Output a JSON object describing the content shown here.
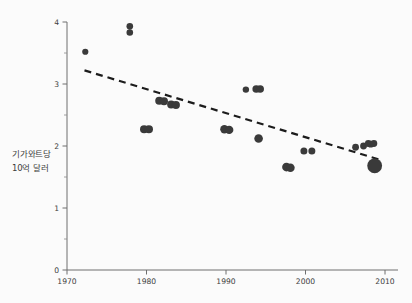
{
  "chart_data": {
    "type": "scatter",
    "title": "",
    "subtitle": "",
    "xlabel": "",
    "ylabel": "기가와트당 10억 달러",
    "ylabel_lines": [
      "기가와트당",
      "10억 달러"
    ],
    "xlim": [
      1970,
      2010
    ],
    "ylim": [
      0,
      4
    ],
    "xticks": [
      1970,
      1980,
      1990,
      2000,
      2010
    ],
    "xtick_labels": [
      "1970",
      "1980",
      "1990",
      "2000",
      "2010"
    ],
    "yticks": [
      0,
      1,
      2,
      3,
      4
    ],
    "ytick_labels": [
      "0",
      "1",
      "2",
      "3",
      "4"
    ],
    "yticks_minor": [
      0.5,
      1.5,
      2.5,
      3.5
    ],
    "grid": false,
    "legend": null,
    "marker_color": "#3a3a3a",
    "points": [
      {
        "x": 1972.3,
        "y": 3.52,
        "size": 3.1
      },
      {
        "x": 1977.9,
        "y": 3.93,
        "size": 3.3
      },
      {
        "x": 1977.9,
        "y": 3.83,
        "size": 3.3
      },
      {
        "x": 1979.7,
        "y": 2.27,
        "size": 4.1
      },
      {
        "x": 1980.3,
        "y": 2.27,
        "size": 4.1
      },
      {
        "x": 1981.6,
        "y": 2.73,
        "size": 4.0
      },
      {
        "x": 1982.2,
        "y": 2.72,
        "size": 4.0
      },
      {
        "x": 1983.1,
        "y": 2.67,
        "size": 4.0
      },
      {
        "x": 1983.7,
        "y": 2.66,
        "size": 4.0
      },
      {
        "x": 1989.8,
        "y": 2.27,
        "size": 4.2
      },
      {
        "x": 1990.4,
        "y": 2.26,
        "size": 4.2
      },
      {
        "x": 1992.5,
        "y": 2.91,
        "size": 3.2
      },
      {
        "x": 1993.8,
        "y": 2.92,
        "size": 3.8
      },
      {
        "x": 1994.3,
        "y": 2.92,
        "size": 3.8
      },
      {
        "x": 1994.1,
        "y": 2.12,
        "size": 4.3
      },
      {
        "x": 1997.6,
        "y": 1.66,
        "size": 4.3
      },
      {
        "x": 1998.1,
        "y": 1.65,
        "size": 4.3
      },
      {
        "x": 1999.8,
        "y": 1.92,
        "size": 3.5
      },
      {
        "x": 2000.8,
        "y": 1.92,
        "size": 3.5
      },
      {
        "x": 2006.3,
        "y": 1.98,
        "size": 3.4
      },
      {
        "x": 2007.3,
        "y": 2.0,
        "size": 3.4
      },
      {
        "x": 2007.9,
        "y": 2.04,
        "size": 3.4
      },
      {
        "x": 2008.2,
        "y": 2.03,
        "size": 3.4
      },
      {
        "x": 2008.6,
        "y": 2.04,
        "size": 3.4
      },
      {
        "x": 2008.7,
        "y": 1.68,
        "size": 7.4
      }
    ],
    "trendline": {
      "style": "dashed",
      "color": "#1c1c1c",
      "x_start": 1972.2,
      "y_start": 3.22,
      "x_end": 2009.6,
      "y_end": 1.77
    }
  }
}
